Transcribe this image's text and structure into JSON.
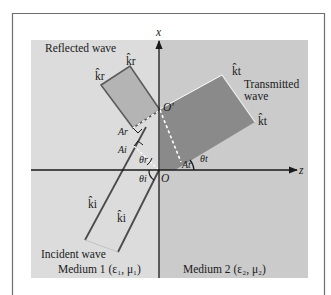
{
  "figure": {
    "type": "oblique incidence diagram",
    "axes": {
      "vertical_label": "x",
      "horizontal_label": "z",
      "origin_label": "O",
      "secondary_origin_label": "O′"
    },
    "labels": {
      "reflected_wave": "Reflected wave",
      "transmitted_wave_line1": "Transmitted",
      "transmitted_wave_line2": "wave",
      "incident_wave": "Incident wave",
      "medium1": "Medium 1 (ε₁, μ₁)",
      "medium2": "Medium 2 (ε₂, μ₂)"
    },
    "vectors": {
      "k_r": "k̂r",
      "k_t": "k̂t",
      "k_i": "k̂i"
    },
    "points": {
      "A_r": "Ar",
      "A_i": "Ai",
      "A_t": "At"
    },
    "angles": {
      "theta_r": "θr",
      "theta_i": "θi",
      "theta_t": "θt"
    },
    "colors": {
      "frame": "#6e6e6e",
      "medium1_bg": "#dcdcdc",
      "medium2_bg": "#cbcbcb",
      "reflected_fill": "#b4b4b4",
      "transmitted_fill": "#8a8a8a",
      "line": "#4a4a4a"
    }
  }
}
